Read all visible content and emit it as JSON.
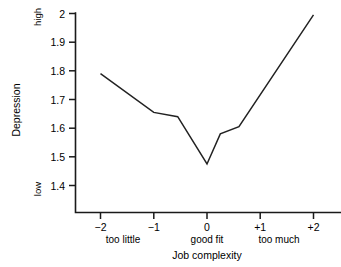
{
  "chart_data": {
    "type": "line",
    "title": "",
    "xlabel": "Job complexity",
    "ylabel": "Depression",
    "xlim": [
      -2.25,
      2.25
    ],
    "ylim": [
      1.33,
      2.02
    ],
    "grid": false,
    "legend": "none",
    "x_ticks": [
      "−2",
      "−1",
      "0",
      "+1",
      "+2"
    ],
    "x_tick_values": [
      -2,
      -1,
      0,
      1,
      2
    ],
    "x_category_labels": [
      {
        "label": "too little",
        "at": -1.7
      },
      {
        "label": "good fit",
        "at": 0.0
      },
      {
        "label": "too much",
        "at": 1.35
      }
    ],
    "y_ticks": [
      "1.4",
      "1.5",
      "1.6",
      "1.7",
      "1.8",
      "1.9",
      "2"
    ],
    "y_tick_values": [
      1.4,
      1.5,
      1.6,
      1.7,
      1.8,
      1.9,
      2.0
    ],
    "y_range_labels": [
      {
        "label": "high",
        "at": 2.0
      },
      {
        "label": "low",
        "at": 1.4
      }
    ],
    "series": [
      {
        "name": "Depression",
        "color": "#222222",
        "x": [
          -2.0,
          -1.0,
          -0.55,
          0.0,
          0.25,
          0.6,
          2.0
        ],
        "values": [
          1.79,
          1.655,
          1.64,
          1.475,
          1.58,
          1.605,
          1.995
        ]
      }
    ]
  },
  "axis": {
    "y_title": "Depression",
    "x_title": "Job complexity"
  }
}
